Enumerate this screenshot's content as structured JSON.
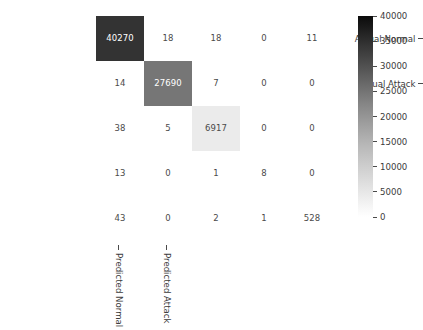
{
  "chart_data": {
    "type": "heatmap",
    "title": "",
    "xlabel": "",
    "ylabel": "",
    "colormap": "Greys",
    "grid": false,
    "legend_position": "right-colorbar",
    "rows": 5,
    "cols": 5,
    "x_tick_labels": [
      "Predicted Normal",
      "Predicted Attack",
      "",
      "",
      ""
    ],
    "y_tick_labels": [
      "Actual Normal",
      "Actual Attack",
      "",
      "",
      ""
    ],
    "values": [
      [
        40270,
        18,
        18,
        0,
        11
      ],
      [
        14,
        27690,
        7,
        0,
        0
      ],
      [
        38,
        5,
        6917,
        0,
        0
      ],
      [
        13,
        0,
        1,
        8,
        0
      ],
      [
        43,
        0,
        2,
        1,
        528
      ]
    ],
    "cell_fills": [
      [
        "#333333",
        "#ffffff",
        "#ffffff",
        "#ffffff",
        "#ffffff"
      ],
      [
        "#ffffff",
        "#767676",
        "#ffffff",
        "#ffffff",
        "#ffffff"
      ],
      [
        "#ffffff",
        "#ffffff",
        "#ebebeb",
        "#ffffff",
        "#ffffff"
      ],
      [
        "#ffffff",
        "#ffffff",
        "#ffffff",
        "#ffffff",
        "#ffffff"
      ],
      [
        "#ffffff",
        "#ffffff",
        "#ffffff",
        "#ffffff",
        "#ffffff"
      ]
    ],
    "cell_text_colors": [
      [
        "#ffffff",
        "#4a4a4a",
        "#4a4a4a",
        "#4a4a4a",
        "#4a4a4a"
      ],
      [
        "#4a4a4a",
        "#ffffff",
        "#4a4a4a",
        "#4a4a4a",
        "#4a4a4a"
      ],
      [
        "#4a4a4a",
        "#4a4a4a",
        "#4a4a4a",
        "#4a4a4a",
        "#4a4a4a"
      ],
      [
        "#4a4a4a",
        "#4a4a4a",
        "#4a4a4a",
        "#4a4a4a",
        "#4a4a4a"
      ],
      [
        "#4a4a4a",
        "#4a4a4a",
        "#4a4a4a",
        "#4a4a4a",
        "#4a4a4a"
      ]
    ],
    "colorbar": {
      "min": 0,
      "max": 40000,
      "tick_values": [
        40000,
        35000,
        30000,
        25000,
        20000,
        15000,
        10000,
        5000,
        0
      ],
      "tick_labels": [
        "40000",
        "35000",
        "30000",
        "25000",
        "20000",
        "15000",
        "10000",
        "5000",
        "0"
      ],
      "orientation": "vertical"
    }
  }
}
